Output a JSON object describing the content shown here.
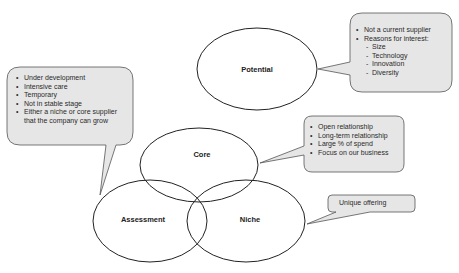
{
  "diagram": {
    "type": "venn-with-callouts",
    "circles": [
      {
        "id": "potential",
        "label": "Potential"
      },
      {
        "id": "core",
        "label": "Core"
      },
      {
        "id": "assessment",
        "label": "Assessment"
      },
      {
        "id": "niche",
        "label": "Niche"
      }
    ],
    "callouts": {
      "assessment": {
        "items": [
          "Under development",
          "Intensive care",
          "Temporary",
          "Not in stable stage",
          "Either a niche or core supplier",
          "that the company can grow"
        ]
      },
      "potential": {
        "items": [
          "Not a current supplier",
          "Reasons for interest:"
        ],
        "subitems": [
          "Size",
          "Technology",
          "Innovation",
          "Diversity"
        ]
      },
      "core": {
        "items": [
          "Open relationship",
          "Long-term relationship",
          "Large % of spend",
          "Focus on our business"
        ]
      },
      "niche": {
        "text": "Unique offering"
      }
    },
    "colors": {
      "callout_fill": "#e6e6e6",
      "callout_stroke": "#555555",
      "ellipse_stroke": "#222222"
    }
  }
}
